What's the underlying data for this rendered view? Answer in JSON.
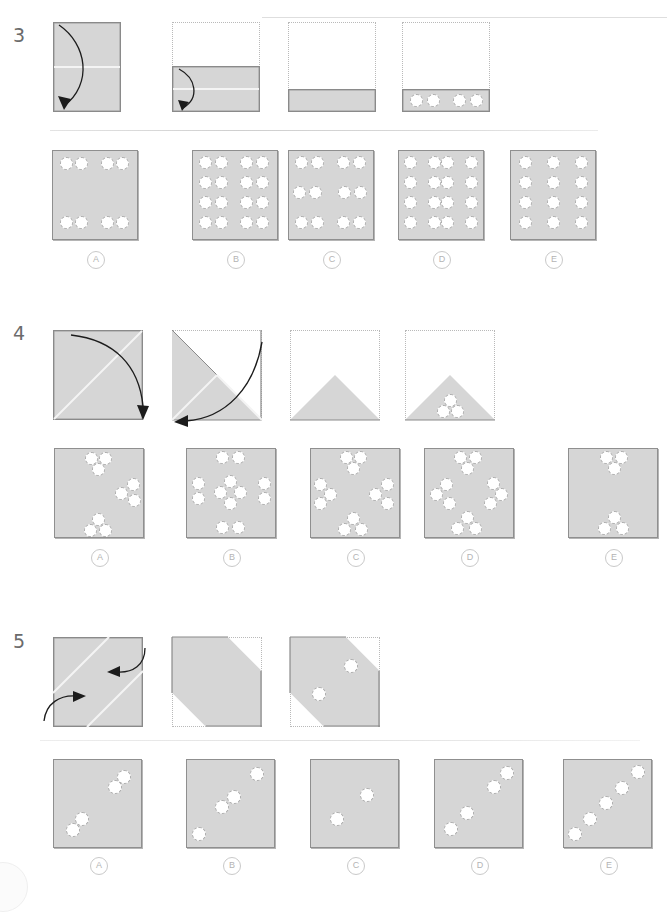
{
  "page": {
    "width": 667,
    "height": 886,
    "paper_color": "#d6d6d6",
    "hole_color": "#ffffff",
    "edge_color": "#8a8a8a",
    "ghost_color": "#b9b9b9"
  },
  "questions": [
    {
      "number": "3",
      "fold_axis": "horizontal",
      "steps": [
        {
          "label": "step-1",
          "kind": "square-full",
          "arrow": "fold-down",
          "creases": [
            "horizontal-middle"
          ]
        },
        {
          "label": "step-2",
          "kind": "half-bottom",
          "arrow": "fold-down",
          "creases": [
            "horizontal-middle"
          ]
        },
        {
          "label": "step-3",
          "kind": "quarter-bottom",
          "arrow": "none",
          "creases": []
        },
        {
          "label": "step-4",
          "kind": "quarter-bottom-punched",
          "arrow": "none",
          "holes": 4
        }
      ],
      "options": [
        {
          "letter": "A",
          "holes": 8,
          "pattern": "4-top 4-bottom"
        },
        {
          "letter": "B",
          "holes": 16,
          "pattern": "4x4 grid"
        },
        {
          "letter": "C",
          "holes": 12,
          "pattern": "4 top, 4 middle, 4 bottom"
        },
        {
          "letter": "D",
          "holes": 16,
          "pattern": "4x4 grid uneven spacing"
        },
        {
          "letter": "E",
          "holes": 12,
          "pattern": "3 columns x 4 rows"
        }
      ]
    },
    {
      "number": "4",
      "fold_axis": "diagonal",
      "steps": [
        {
          "label": "step-1",
          "kind": "square-full",
          "arrow": "fold-diagonal-down",
          "creases": [
            "diagonal"
          ]
        },
        {
          "label": "step-2",
          "kind": "triangle-lower-left",
          "arrow": "fold-diagonal-left",
          "creases": [
            "diagonal"
          ]
        },
        {
          "label": "step-3",
          "kind": "triangle-up",
          "arrow": "none",
          "creases": []
        },
        {
          "label": "step-4",
          "kind": "triangle-up-punched",
          "arrow": "none",
          "holes": 3
        }
      ],
      "options": [
        {
          "letter": "A",
          "holes": 12,
          "pattern": "3 clusters of 3 plus scatter"
        },
        {
          "letter": "B",
          "holes": 12,
          "pattern": "ring pattern with side pairs"
        },
        {
          "letter": "C",
          "holes": 12,
          "pattern": "4 clusters of 3"
        },
        {
          "letter": "D",
          "holes": 12,
          "pattern": "4 clusters of 3 rotated"
        },
        {
          "letter": "E",
          "holes": 6,
          "pattern": "2 clusters of 3"
        }
      ]
    },
    {
      "number": "5",
      "fold_axis": "diagonal-band",
      "steps": [
        {
          "label": "step-1",
          "kind": "square-full",
          "arrow": "fold-corner-in-two",
          "creases": [
            "diagonal-band"
          ]
        },
        {
          "label": "step-2",
          "kind": "diagonal-band",
          "arrow": "none",
          "creases": []
        },
        {
          "label": "step-3",
          "kind": "diagonal-band-punched",
          "arrow": "none",
          "holes": 2
        }
      ],
      "options": [
        {
          "letter": "A",
          "holes": 4,
          "pattern": "two pairs on diagonal"
        },
        {
          "letter": "B",
          "holes": 4,
          "pattern": "one top-right, pair center, one lower-left"
        },
        {
          "letter": "C",
          "holes": 2,
          "pattern": "two holes"
        },
        {
          "letter": "D",
          "holes": 4,
          "pattern": "diagonal stagger"
        },
        {
          "letter": "E",
          "holes": 5,
          "pattern": "five on diagonal"
        }
      ]
    }
  ],
  "option_letters": [
    "A",
    "B",
    "C",
    "D",
    "E"
  ]
}
